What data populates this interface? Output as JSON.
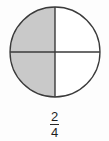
{
  "figure": {
    "name": "fraction-circle-diagram",
    "shape": "circle",
    "total_parts": 4,
    "shaded_parts": 2,
    "shaded_positions": [
      "upper-left",
      "lower-left"
    ],
    "unshaded_positions": [
      "upper-right",
      "lower-right"
    ],
    "colors": {
      "shaded_fill": "#c9c9c9",
      "unshaded_fill": "#ffffff",
      "outline": "#3a3a3a",
      "divider": "#3a3a3a",
      "background": "#fdfdfd",
      "text": "#1d1d1d"
    },
    "geometry": {
      "center_x": 46,
      "center_y": 46,
      "radius": 45
    },
    "icon_names": {
      "circle_outline": "circle-outline-icon",
      "vertical_divider": "vertical-divider-icon",
      "horizontal_divider": "horizontal-divider-icon"
    }
  },
  "fraction": {
    "numerator": "2",
    "denominator": "4",
    "text": "2/4"
  }
}
